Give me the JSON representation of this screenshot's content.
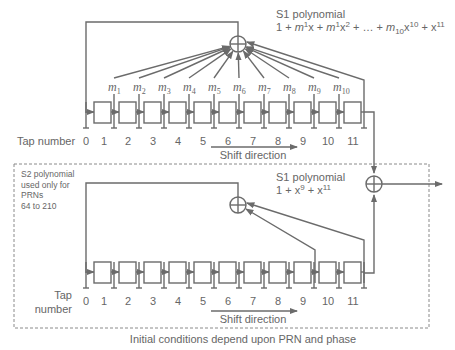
{
  "top_register": {
    "polynomial_title": "S1 polynomial",
    "polynomial_formula": {
      "parts": [
        "1 + ",
        "m",
        "1",
        "x + ",
        "m",
        "1",
        "x",
        "2",
        " + … + ",
        "m",
        "10",
        "x",
        "10",
        " + x",
        "11"
      ]
    },
    "tap_number_label": "Tap number",
    "tap_numbers": [
      "0",
      "1",
      "2",
      "3",
      "4",
      "5",
      "6",
      "7",
      "8",
      "9",
      "10",
      "11"
    ],
    "multipliers": [
      {
        "sym": "m",
        "sub": "1"
      },
      {
        "sym": "m",
        "sub": "2"
      },
      {
        "sym": "m",
        "sub": "3"
      },
      {
        "sym": "m",
        "sub": "4"
      },
      {
        "sym": "m",
        "sub": "5"
      },
      {
        "sym": "m",
        "sub": "6"
      },
      {
        "sym": "m",
        "sub": "7"
      },
      {
        "sym": "m",
        "sub": "8"
      },
      {
        "sym": "m",
        "sub": "9"
      },
      {
        "sym": "m",
        "sub": "10"
      }
    ],
    "shift_label": "Shift direction"
  },
  "bottom_register": {
    "note_lines": [
      "S2 polynomial",
      "used only for",
      "PRNs",
      "64 to 210"
    ],
    "polynomial_title": "S1 polynomial",
    "polynomial_formula": {
      "parts": [
        "1 + x",
        "9",
        " + x",
        "11"
      ]
    },
    "tap_number_label_lines": [
      "Tap",
      "number"
    ],
    "tap_numbers": [
      "0",
      "1",
      "2",
      "3",
      "4",
      "5",
      "6",
      "7",
      "8",
      "9",
      "10",
      "11"
    ],
    "shift_label": "Shift direction"
  },
  "caption": "Initial conditions depend upon PRN and phase",
  "icons": {
    "xor": "circle-plus-icon",
    "arrow": "arrow-right-icon"
  }
}
